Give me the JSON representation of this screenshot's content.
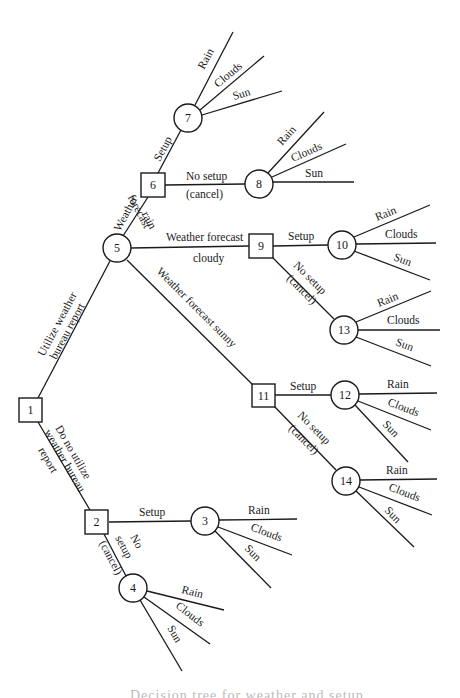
{
  "diagram": {
    "type": "decision-tree",
    "nodes": [
      {
        "id": "1",
        "kind": "decision",
        "label": "1"
      },
      {
        "id": "2",
        "kind": "decision",
        "label": "2"
      },
      {
        "id": "3",
        "kind": "chance",
        "label": "3"
      },
      {
        "id": "4",
        "kind": "chance",
        "label": "4"
      },
      {
        "id": "5",
        "kind": "chance",
        "label": "5"
      },
      {
        "id": "6",
        "kind": "decision",
        "label": "6"
      },
      {
        "id": "7",
        "kind": "chance",
        "label": "7"
      },
      {
        "id": "8",
        "kind": "chance",
        "label": "8"
      },
      {
        "id": "9",
        "kind": "decision",
        "label": "9"
      },
      {
        "id": "10",
        "kind": "chance",
        "label": "10"
      },
      {
        "id": "11",
        "kind": "decision",
        "label": "11"
      },
      {
        "id": "12",
        "kind": "chance",
        "label": "12"
      },
      {
        "id": "13",
        "kind": "chance",
        "label": "13"
      },
      {
        "id": "14",
        "kind": "chance",
        "label": "14"
      }
    ],
    "edges": {
      "n1_n5": {
        "line1": "Utilize weather",
        "line2": "bureau report"
      },
      "n1_n2": {
        "line1": "Do no utilize",
        "line2": "weather bureau",
        "line3": "report"
      },
      "n2_n3": {
        "line1": "Setup"
      },
      "n2_n4": {
        "line1": "No",
        "line2": "setup",
        "line3": "(cancel)"
      },
      "n5_n6": {
        "line1": "Weather",
        "line2": "forecast",
        "line3": "rain"
      },
      "n5_n9": {
        "line1": "Weather forecast",
        "line2": "cloudy"
      },
      "n5_n11": {
        "line1": "Weather forecast sunny"
      },
      "n6_n7": {
        "line1": "Setup"
      },
      "n6_n8": {
        "line1": "No setup",
        "line2": "(cancel)"
      },
      "n9_n10": {
        "line1": "Setup"
      },
      "n9_n13": {
        "line1": "No setup",
        "line2": "(cancel)"
      },
      "n11_n12": {
        "line1": "Setup"
      },
      "n11_n14": {
        "line1": "No setup",
        "line2": "(cancel)"
      }
    },
    "outcomes": {
      "rain": "Rain",
      "clouds": "Clouds",
      "sun": "Sun"
    }
  },
  "caption": "Decision tree for weather and setup"
}
